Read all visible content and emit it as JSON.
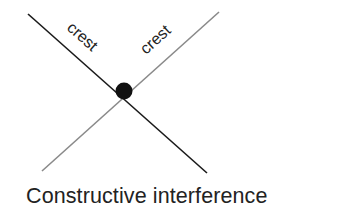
{
  "diagram": {
    "title": "Constructive interference",
    "wave_a": {
      "label": "crest",
      "color": "#1a1a1a"
    },
    "wave_b": {
      "label": "crest",
      "color": "#8a8a8a"
    },
    "intersection": {
      "color": "#111111"
    }
  }
}
